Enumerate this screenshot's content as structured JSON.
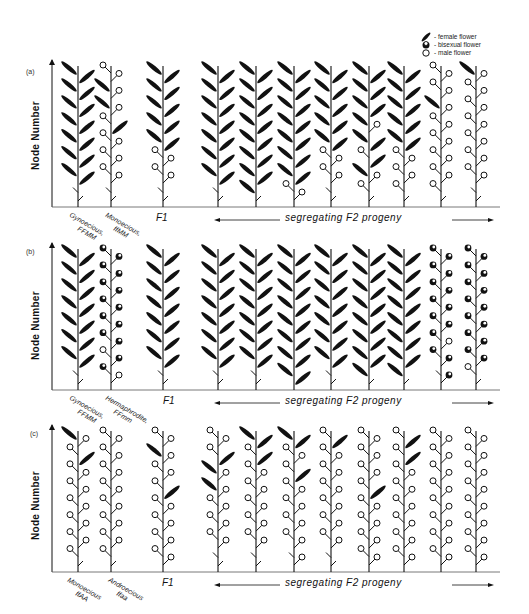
{
  "legend": {
    "items": [
      {
        "symbol": "female-flower",
        "label": "- female flower"
      },
      {
        "symbol": "bisexual-flower",
        "label": "- bisexual flower"
      },
      {
        "symbol": "male-flower",
        "label": "- male flower"
      }
    ]
  },
  "y_axis_label": "Node Number",
  "segregating_label": "segregating  F2  progeny",
  "f1_label": "F1",
  "colors": {
    "ink": "#111111",
    "background": "#ffffff"
  },
  "panels": [
    {
      "letter": "(a)",
      "parents": [
        {
          "line1": "Gynoecious,",
          "line2": "FFMM"
        },
        {
          "line1": "Monoecious,",
          "line2": "ffMM"
        }
      ],
      "plants_note": "F = female leaf/flower, M = male, B = bisexual, L = bare leaf tick; nodes listed bottom-to-top, left and right sides"
    },
    {
      "letter": "(b)",
      "parents": [
        {
          "line1": "Gynoecious,",
          "line2": "FFMM"
        },
        {
          "line1": "Hermaphrodite,",
          "line2": "FFmm"
        }
      ]
    },
    {
      "letter": "(c)",
      "parents": [
        {
          "line1": "Monoecious",
          "line2": "ffAA"
        },
        {
          "line1": "Androecious",
          "line2": "ffaa"
        }
      ]
    }
  ]
}
